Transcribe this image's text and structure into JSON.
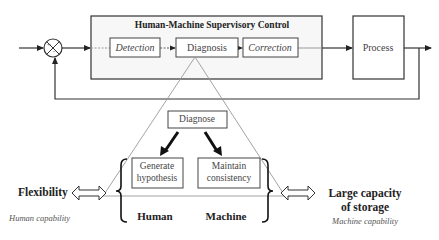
{
  "diagram": {
    "supervisory_box": {
      "title": "Human-Machine Supervisory Control",
      "stages": [
        {
          "label": "Detection",
          "style": "italic"
        },
        {
          "label": "Diagnosis",
          "style": "normal"
        },
        {
          "label": "Correction",
          "style": "italic"
        }
      ]
    },
    "summing_junction": {
      "plus": "+",
      "minus": "-"
    },
    "process": {
      "label": "Process"
    },
    "zoom_detail": {
      "top": {
        "label": "Diagnose"
      },
      "left_task": {
        "line1": "Generate",
        "line2": "hypothesis"
      },
      "right_task": {
        "line1": "Maintain",
        "line2": "consistency"
      },
      "human_label": "Human",
      "machine_label": "Machine"
    },
    "left_capability": {
      "title": "Flexibility",
      "caption": "Human capability"
    },
    "right_capability": {
      "title_line1": "Large capacity",
      "title_line2": "of storage",
      "caption": "Machine capability"
    },
    "colors": {
      "line": "#333333",
      "thin_line": "#888888",
      "box_fill": "#ffffff",
      "outer_box_fill": "#f7f7f7",
      "text": "#333333"
    }
  }
}
